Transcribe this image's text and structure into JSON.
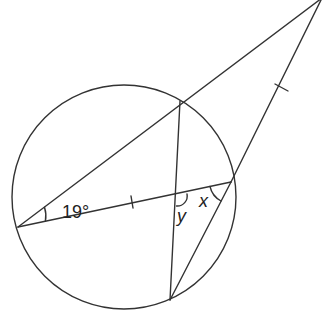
{
  "diagram": {
    "type": "circle-geometry",
    "stroke_color": "#333333",
    "background": "#ffffff",
    "circle": {
      "cx": 124,
      "cy": 197,
      "r": 112
    },
    "points": {
      "left": [
        18,
        227
      ],
      "top": [
        180,
        101
      ],
      "right": [
        231,
        182
      ],
      "bottom": [
        170,
        300
      ],
      "intersection": [
        177,
        196
      ],
      "apex": [
        322,
        -2
      ]
    },
    "labels": {
      "angle_given": "19°",
      "angle_x": "x",
      "angle_y": "y"
    },
    "tick_marks": [
      "left-right chord",
      "right-apex segment"
    ]
  }
}
